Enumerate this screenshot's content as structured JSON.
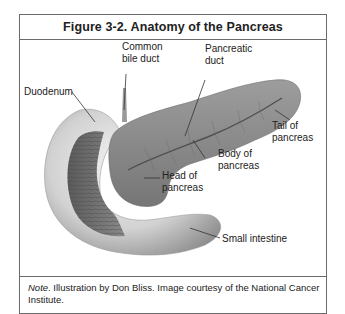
{
  "figure": {
    "title": "Figure 3-2. Anatomy of the Pancreas",
    "labels": {
      "common_bile_duct_line1": "Common",
      "common_bile_duct_line2": "bile duct",
      "pancreatic_duct_line1": "Pancreatic",
      "pancreatic_duct_line2": "duct",
      "duodenum": "Duodenum",
      "tail_line1": "Tail of",
      "tail_line2": "pancreas",
      "body_line1": "Body of",
      "body_line2": "pancreas",
      "head_line1": "Head of",
      "head_line2": "pancreas",
      "small_intestine": "Small intestine"
    },
    "note": {
      "prefix": "Note",
      "text": ". Illustration by Don Bliss. Image courtesy of the National Cancer Institute."
    },
    "colors": {
      "border": "#6b6b6b",
      "pancreas": "#8a8a8a",
      "intestine": "#c8c8c8",
      "intestine_dark": "#6e6e6e"
    }
  }
}
